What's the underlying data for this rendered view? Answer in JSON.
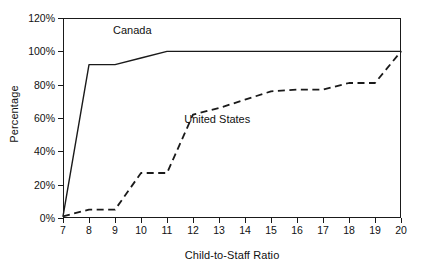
{
  "chart_data": {
    "type": "line",
    "title": "",
    "subtitle": "",
    "xlabel": "Child-to-Staff Ratio",
    "ylabel": "Percentage",
    "xlim": [
      7,
      20
    ],
    "ylim": [
      0,
      120
    ],
    "grid": false,
    "legend_position": "inline-annotation",
    "x_tick_labels": [
      "7",
      "8",
      "9",
      "10",
      "11",
      "12",
      "13",
      "14",
      "15",
      "16",
      "17",
      "18",
      "19",
      "20"
    ],
    "x": [
      7,
      8,
      9,
      10,
      11,
      12,
      13,
      14,
      15,
      16,
      17,
      18,
      19,
      20
    ],
    "y_tick_labels": [
      "0%",
      "20%",
      "40%",
      "60%",
      "80%",
      "100%",
      "120%"
    ],
    "y_ticks": [
      0,
      20,
      40,
      60,
      80,
      100,
      120
    ],
    "series": [
      {
        "name": "Canada",
        "style": "solid",
        "color": "#1a1a1a",
        "values": [
          1,
          92,
          92,
          96,
          100,
          100,
          100,
          100,
          100,
          100,
          100,
          100,
          100,
          100
        ]
      },
      {
        "name": "United States",
        "style": "dashed",
        "color": "#1a1a1a",
        "values": [
          1,
          5,
          5,
          27,
          27,
          62,
          66,
          71,
          76,
          77,
          77,
          81,
          81,
          100
        ]
      }
    ],
    "annotations": [
      {
        "text": "Canada",
        "x": 10,
        "y": 112
      },
      {
        "text": "United States",
        "x": 13.2,
        "y": 59
      }
    ]
  },
  "axis": {
    "y_title": "Percentage",
    "x_title": "Child-to-Staff Ratio"
  },
  "colors": {
    "axis": "#1a1a1a",
    "text": "#111111",
    "background": "#ffffff",
    "canada": "#1a1a1a",
    "united_states": "#1a1a1a"
  }
}
